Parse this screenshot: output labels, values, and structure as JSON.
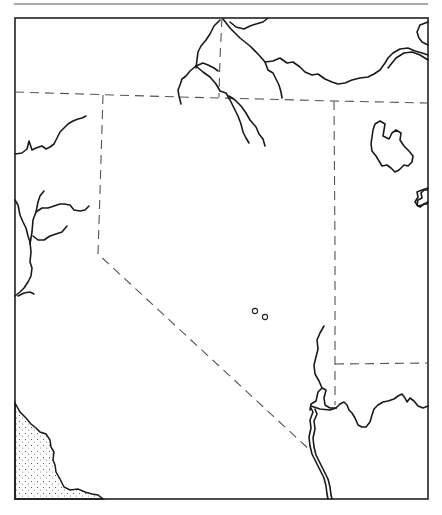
{
  "map": {
    "type": "outline-map",
    "colors": {
      "background": "#ffffff",
      "lines": "#1a1a1a",
      "borders": "#555555"
    },
    "features": {
      "frame": "rectangular map border",
      "state_borders": "dashed",
      "rivers": "solid wavy lines",
      "lakes": [
        "northeast lake outline",
        "small eastern-edge lake"
      ],
      "coastline": "stippled ocean in southwest corner",
      "point_markers": 2
    }
  }
}
